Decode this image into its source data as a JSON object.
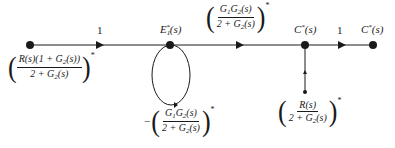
{
  "diagram": {
    "type": "signal-flow-graph",
    "nodes": [
      {
        "id": "input",
        "label": ""
      },
      {
        "id": "E1",
        "label_main": "E",
        "label_sub": "1",
        "label_sup": "*",
        "label_tail": "(s)"
      },
      {
        "id": "C1",
        "label_main": "C",
        "label_sup": "*",
        "label_tail": "(s)"
      },
      {
        "id": "C2",
        "label_main": "C",
        "label_sup": "*",
        "label_tail": "(s)"
      }
    ],
    "branches": {
      "input_to_E1": {
        "gain": "1"
      },
      "E1_to_C1": {
        "num_a": "G",
        "num_a_sub": "1",
        "num_b": "G",
        "num_b_sub": "2",
        "num_tail": "(s)",
        "den_a": "2 + G",
        "den_sub": "2",
        "den_tail": "(s)",
        "star": "*"
      },
      "C1_to_C2": {
        "gain": "1"
      },
      "E1_self_loop": {
        "sign": "−",
        "num_a": "G",
        "num_a_sub": "1",
        "num_b": "G",
        "num_b_sub": "2",
        "num_tail": "(s)",
        "den_a": "2 + G",
        "den_sub": "2",
        "den_tail": "(s)",
        "star": "*"
      },
      "R_to_C1": {
        "num": "R(s)",
        "den_a": "2 + G",
        "den_sub": "2",
        "den_tail": "(s)",
        "star": "*"
      }
    },
    "input_label": {
      "num_a": "R(s)(1 + G",
      "num_sub": "2",
      "num_tail": "(s))",
      "den_a": "2 + G",
      "den_sub": "2",
      "den_tail": "(s)",
      "star": "*"
    },
    "colors": {
      "line": "#1a1a1a",
      "background": "#ffffff"
    }
  }
}
